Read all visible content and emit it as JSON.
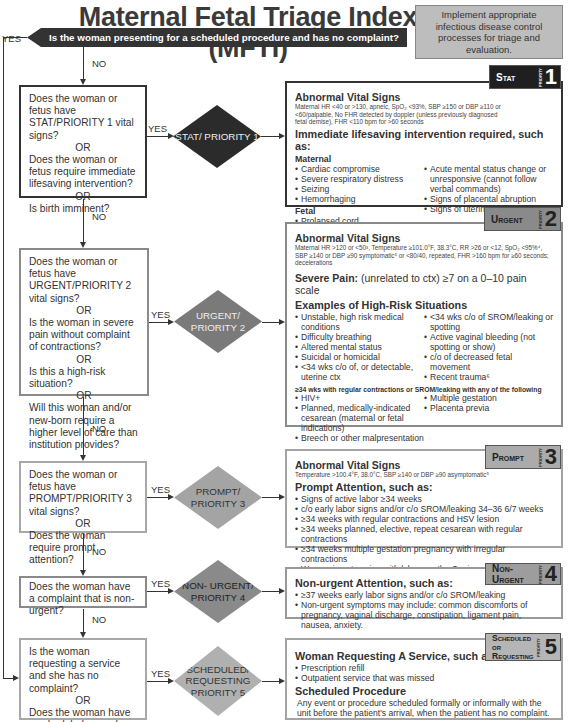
{
  "title": "Maternal Fetal Triage Index (MFTI)",
  "infobox": "Implement appropriate infectious disease control processes for triage and evaluation.",
  "top_question": "Is the woman presenting for a scheduled procedure and has no complaint?",
  "labels": {
    "yes": "YES",
    "no": "NO",
    "or": "OR"
  },
  "questions": {
    "q1": [
      "Does the woman or fetus have STAT/PRIORITY 1 vital signs?",
      "Does the woman or fetus require immediate lifesaving intervention?",
      "Is birth imminent?"
    ],
    "q2": [
      "Does the woman or fetus have URGENT/PRIORITY 2 vital signs?",
      "Is the woman in severe pain without complaint of contractions?",
      "Is this a high-risk situation?",
      "Will this woman and/or new-born require a higher level of care than institution provides?"
    ],
    "q3": [
      "Does the woman or fetus have PROMPT/PRIORITY 3 vital signs?",
      "Does the woman require prompt attention?"
    ],
    "q4": [
      "Does the woman have a complaint that is non-urgent?"
    ],
    "q5": [
      "Is the woman requesting a service and she has no complaint?",
      "Does the woman have a scheduled procedure with no complaint?"
    ]
  },
  "diamonds": {
    "d1": "STAT/ PRIORITY 1",
    "d2": "URGENT/ PRIORITY 2",
    "d3": "PROMPT/ PRIORITY 3",
    "d4": "NON- URGENT/ PRIORITY 4",
    "d5": "SCHEDULED/ REQUESTING PRIORITY 5"
  },
  "badges": {
    "b1": {
      "label": "Stat",
      "num": "1",
      "side": "PRIORITY"
    },
    "b2": {
      "label": "Urgent",
      "num": "2",
      "side": "PRIORITY"
    },
    "b3": {
      "label": "Prompt",
      "num": "3",
      "side": "PRIORITY"
    },
    "b4": {
      "label": "Non-Urgent",
      "num": "4",
      "side": "PRIORITY"
    },
    "b5": {
      "label": "Scheduled or Requesting",
      "num": "5",
      "side": "PRIORITY"
    }
  },
  "p1": {
    "h1": "Abnormal Vital Signs",
    "vitals": "Maternal HR <40 or >130, apneic, SpO₂ <93%, SBP ≥150 or DBP ≥110 or <60/palpable, No FHR detected by doppler (unless previously diagnosed fetal demise), FHR <110 bpm for >60 seconds",
    "h2": "Immediate lifesaving intervention required, such as:",
    "maternal_h": "Maternal",
    "maternal_left": [
      "Cardiac compromise",
      "Severe respiratory distress",
      "Seizing",
      "Hemorrhaging"
    ],
    "maternal_right": [
      "Acute mental status change or unresponsive (cannot follow verbal commands)",
      "Signs of placental abruption",
      "Signs of uterine rupture"
    ],
    "fetal_h": "Fetal",
    "fetal": [
      "Prolapsed cord"
    ],
    "birth_h": "Imminent Birth",
    "birth_left": [
      "Fetal parts visible on the perineum"
    ],
    "birth_right": [
      "Active maternal bearing-down efforts"
    ]
  },
  "p2": {
    "h1": "Abnormal Vital Signs",
    "vitals": "Maternal HR >120 or <50³, Temperature ≥101.0°F, 38.3°C, RR >26 or <12, SpO₂ <95%⁴, SBP ≥140 or DBP ≥90 symptomatic⁵ or <80/40, repeated, FHR >160 bpm for ≥60 seconds; decelerations",
    "pain_h": "Severe Pain:",
    "pain": " (unrelated to ctx) ≥7 on a 0–10 pain scale",
    "risk_h": "Examples of High-Risk Situations",
    "risk_left": [
      "Unstable, high risk medical conditions",
      "Difficulty breathing",
      "Altered mental status",
      "Suicidal or homicidal",
      "<34 wks c/o of, or detectable, uterine ctx"
    ],
    "risk_right": [
      "<34 wks c/o of SROM/leaking or spotting",
      "Active vaginal bleeding (not spotting or show)",
      "c/o of decreased fetal movement",
      "Recent trauma⁶"
    ],
    "wks_h": "≥34 wks with regular contractions or SROM/leaking with any of the following",
    "wks_left": [
      "HIV+",
      "Planned, medically-indicated cesarean (maternal or fetal indications)",
      "Breech or other malpresentation"
    ],
    "wks_right": [
      "Multiple gestation",
      "Placenta previa"
    ],
    "transfer_h": "Transfer of Care Needed",
    "transfer": [
      "Clinical needs of women and/or newborn indicate transfer of care, per hospital policy"
    ]
  },
  "p3": {
    "h1": "Abnormal Vital Signs",
    "vitals": "Temperature >100.4°F, 38.0°C, SBP ≥140 or DBP ≥90 asymptomatic⁵",
    "h2": "Prompt Attention, such as:",
    "items": [
      "Signs of active labor ≥34 weeks",
      "c/o early labor signs and/or c/o SROM/leaking 34–36 6/7 weeks",
      "≥34 weeks with regular contractions and HSV lesion",
      "≥34 weeks planned, elective, repeat cesarean with regular contractions",
      "≥34 weeks multiple gestation pregnancy with irregular contractions",
      "Woman is not coping with labor per the Coping with Labor Algorithm V2⁷"
    ]
  },
  "p4": {
    "h1": "Non-urgent Attention, such as:",
    "items": [
      "≥37 weeks early labor signs and/or c/o SROM/leaking",
      "Non-urgent symptoms may include: common discomforts of pregnancy, vaginal discharge, constipation, ligament pain, nausea, anxiety."
    ]
  },
  "p5": {
    "h1": "Woman Requesting A Service, such as:",
    "items": [
      "Prescription refill",
      "Outpatient service that was missed"
    ],
    "h2": "Scheduled Procedure",
    "text": "Any event or procedure scheduled formally or informally with the unit before the patient's arrival, when the patient has no complaint."
  }
}
